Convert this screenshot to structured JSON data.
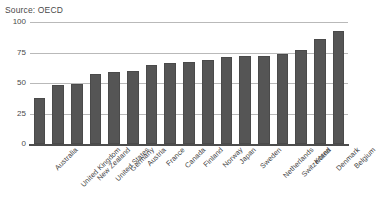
{
  "source_note": "Source: OECD",
  "chart_data": {
    "type": "bar",
    "title": "",
    "subtitle": "",
    "xlabel": "",
    "ylabel": "",
    "ylim": [
      0,
      100
    ],
    "yticks": [
      0,
      25,
      50,
      75,
      100
    ],
    "ytick_labels": [
      "0",
      "25",
      "50",
      "75",
      "100"
    ],
    "grid": true,
    "legend": "none",
    "bar_color": "#555555",
    "gridline_color": "#b9b9b9",
    "axis_color": "#4d4d4d",
    "categories": [
      "Australia",
      "United Kingdom",
      "New Zealand",
      "United States",
      "Germany",
      "Austria",
      "France",
      "Canada",
      "Finland",
      "Norway",
      "Japan",
      "Sweden",
      "Netherlands",
      "Switzerland",
      "Korea",
      "Denmark",
      "Belgium"
    ],
    "values": [
      38,
      48,
      49,
      57,
      59,
      60,
      65,
      66,
      67,
      69,
      71,
      72,
      72,
      74,
      77,
      86,
      93
    ]
  }
}
